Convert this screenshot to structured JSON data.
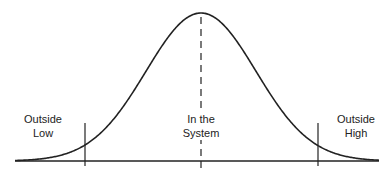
{
  "diagram": {
    "type": "normal-distribution-curve",
    "regions": [
      {
        "id": "low",
        "line1": "Outside",
        "line2": "Low"
      },
      {
        "id": "system",
        "line1": "In the",
        "line2": "System"
      },
      {
        "id": "high",
        "line1": "Outside",
        "line2": "High"
      }
    ],
    "colors": {
      "stroke": "#222222",
      "background": "#ffffff"
    },
    "geometry": {
      "baseline_y": 161,
      "baseline_x_start": 15,
      "baseline_x_end": 379,
      "center_x": 201,
      "peak_y": 13,
      "sigma_px": 55,
      "left_limit_x": 85,
      "right_limit_x": 318
    }
  }
}
